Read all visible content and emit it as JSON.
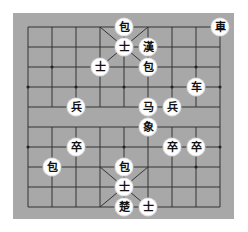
{
  "board": {
    "columns": 9,
    "rows": 10,
    "grid_origin_x": 28,
    "grid_origin_y": 27,
    "col_step": 24,
    "row_step": 20,
    "background_color": "#a8a8a8",
    "line_color": "#333333",
    "river_labels": []
  },
  "pieces": [
    {
      "id": "p0",
      "label": "車",
      "col": 8,
      "row": 0
    },
    {
      "id": "p1",
      "label": "包",
      "col": 4,
      "row": 0
    },
    {
      "id": "p2",
      "label": "士",
      "col": 4,
      "row": 1
    },
    {
      "id": "p3",
      "label": "漢",
      "col": 5,
      "row": 1
    },
    {
      "id": "p4",
      "label": "士",
      "col": 3,
      "row": 2
    },
    {
      "id": "p5",
      "label": "包",
      "col": 5,
      "row": 2
    },
    {
      "id": "p6",
      "label": "车",
      "col": 7,
      "row": 3
    },
    {
      "id": "p7",
      "label": "兵",
      "col": 2,
      "row": 4
    },
    {
      "id": "p8",
      "label": "马",
      "col": 5,
      "row": 4
    },
    {
      "id": "p9",
      "label": "兵",
      "col": 6,
      "row": 4
    },
    {
      "id": "p10",
      "label": "象",
      "col": 5,
      "row": 5
    },
    {
      "id": "p11",
      "label": "卒",
      "col": 2,
      "row": 6
    },
    {
      "id": "p12",
      "label": "卒",
      "col": 6,
      "row": 6
    },
    {
      "id": "p13",
      "label": "卒",
      "col": 7,
      "row": 6
    },
    {
      "id": "p14",
      "label": "包",
      "col": 1,
      "row": 7
    },
    {
      "id": "p15",
      "label": "包",
      "col": 4,
      "row": 7
    },
    {
      "id": "p16",
      "label": "士",
      "col": 4,
      "row": 8
    },
    {
      "id": "p17",
      "label": "楚",
      "col": 4,
      "row": 9
    },
    {
      "id": "p18",
      "label": "士",
      "col": 5,
      "row": 9
    }
  ]
}
